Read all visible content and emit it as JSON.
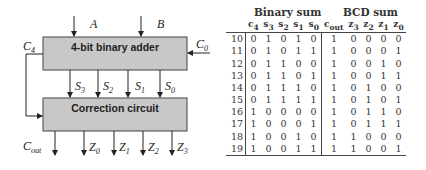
{
  "diagram": {
    "adder_label": "4-bit binary adder",
    "correction_label": "Correction circuit",
    "inputs": {
      "A": "A",
      "B": "B",
      "C0": "C",
      "C0_sub": "0"
    },
    "carry_C4": {
      "base": "C",
      "sub": "4"
    },
    "sum_lines": [
      {
        "base": "S",
        "sub": "3"
      },
      {
        "base": "S",
        "sub": "2"
      },
      {
        "base": "S",
        "sub": "1"
      },
      {
        "base": "S",
        "sub": "0"
      }
    ],
    "outputs": [
      {
        "base": "C",
        "sub": "out"
      },
      {
        "base": "Z",
        "sub": "0"
      },
      {
        "base": "Z",
        "sub": "1"
      },
      {
        "base": "Z",
        "sub": "2"
      },
      {
        "base": "Z",
        "sub": "3"
      }
    ],
    "box_fill": "#c8c8c8",
    "line_color": "#222222"
  },
  "table": {
    "group_headers": [
      "Binary sum",
      "BCD sum"
    ],
    "columns": [
      "",
      "c4",
      "s3",
      "s2",
      "s1",
      "s0",
      "cout",
      "z3",
      "z2",
      "z1",
      "z0"
    ],
    "column_labels": {
      "c4": {
        "base": "c",
        "sub": "4"
      },
      "s3": {
        "base": "s",
        "sub": "3"
      },
      "s2": {
        "base": "s",
        "sub": "2"
      },
      "s1": {
        "base": "s",
        "sub": "1"
      },
      "s0": {
        "base": "s",
        "sub": "0"
      },
      "cout": {
        "base": "c",
        "sub": "out"
      },
      "z3": {
        "base": "z",
        "sub": "3"
      },
      "z2": {
        "base": "z",
        "sub": "2"
      },
      "z1": {
        "base": "z",
        "sub": "1"
      },
      "z0": {
        "base": "z",
        "sub": "0"
      }
    },
    "rows": [
      [
        "10",
        "0",
        "1",
        "0",
        "1",
        "0",
        "1",
        "0",
        "0",
        "0",
        "0"
      ],
      [
        "11",
        "0",
        "1",
        "0",
        "1",
        "1",
        "1",
        "0",
        "0",
        "0",
        "1"
      ],
      [
        "12",
        "0",
        "1",
        "1",
        "0",
        "0",
        "1",
        "0",
        "0",
        "1",
        "0"
      ],
      [
        "13",
        "0",
        "1",
        "1",
        "0",
        "1",
        "1",
        "0",
        "0",
        "1",
        "1"
      ],
      [
        "14",
        "0",
        "1",
        "1",
        "1",
        "0",
        "1",
        "0",
        "1",
        "0",
        "0"
      ],
      [
        "15",
        "0",
        "1",
        "1",
        "1",
        "1",
        "1",
        "0",
        "1",
        "0",
        "1"
      ],
      [
        "16",
        "1",
        "0",
        "0",
        "0",
        "0",
        "1",
        "0",
        "1",
        "1",
        "0"
      ],
      [
        "17",
        "1",
        "0",
        "0",
        "0",
        "1",
        "1",
        "0",
        "1",
        "1",
        "1"
      ],
      [
        "18",
        "1",
        "0",
        "0",
        "1",
        "0",
        "1",
        "1",
        "0",
        "0",
        "0"
      ],
      [
        "19",
        "1",
        "0",
        "0",
        "1",
        "1",
        "1",
        "1",
        "0",
        "0",
        "1"
      ]
    ]
  }
}
